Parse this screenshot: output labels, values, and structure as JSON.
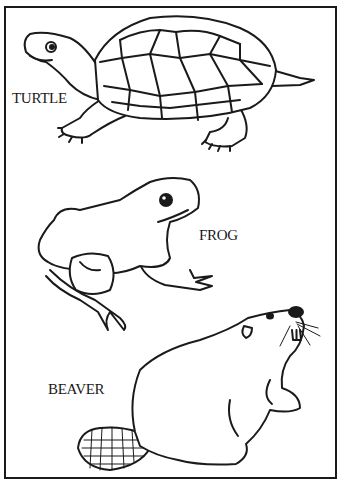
{
  "page": {
    "type": "coloring-page",
    "animals": [
      {
        "name": "turtle",
        "label": "TURTLE"
      },
      {
        "name": "frog",
        "label": "FROG"
      },
      {
        "name": "beaver",
        "label": "BEAVER"
      }
    ]
  },
  "colors": {
    "ink": "#1a1a1a",
    "paper": "#ffffff"
  }
}
